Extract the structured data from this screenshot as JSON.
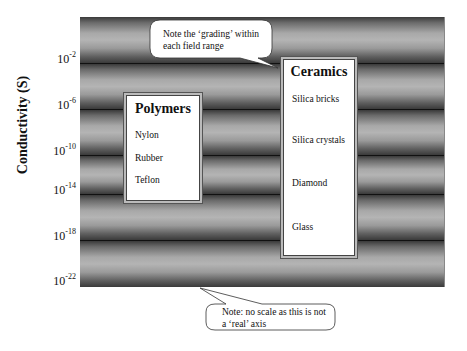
{
  "diagram": {
    "y_axis_label": "Conductivity (S)",
    "y_ticks": [
      {
        "base": "10",
        "exp": "-2"
      },
      {
        "base": "10",
        "exp": "-6"
      },
      {
        "base": "10",
        "exp": "-10"
      },
      {
        "base": "10",
        "exp": "-14"
      },
      {
        "base": "10",
        "exp": "-18"
      },
      {
        "base": "10",
        "exp": "-22"
      }
    ],
    "groups": [
      {
        "title": "Polymers",
        "items": [
          "Nylon",
          "Rubber",
          "Teflon"
        ]
      },
      {
        "title": "Ceramics",
        "items": [
          "Silica bricks",
          "Silica crystals",
          "Diamond",
          "Glass"
        ]
      }
    ],
    "callouts": [
      {
        "lines": [
          "Note the ‘grading’ within",
          "each field range"
        ]
      },
      {
        "lines": [
          "Note: no scale as this is not",
          "a ‘real’ axis"
        ]
      }
    ],
    "band_colors": {
      "dark": "#3a3a3a",
      "light": "#b4b4b4",
      "separator": "#111111"
    }
  }
}
